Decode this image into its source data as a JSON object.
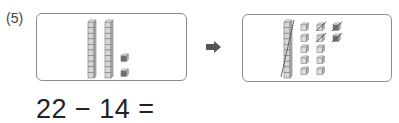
{
  "problem": {
    "number_label": "(5)",
    "equation": "22 − 14 =",
    "arrow_icon": "right-arrow-icon"
  },
  "before_panel": {
    "tens_rods": 2,
    "cubes_per_rod": 10,
    "ones_cubes": 2,
    "ones_color": "#6e6e6e"
  },
  "after_panel": {
    "tens_rods": 1,
    "tens_rods_crossed": 1,
    "ones_columns": [
      {
        "count": 5,
        "crossed": 0,
        "color": "#c8c8c8"
      },
      {
        "count": 5,
        "crossed": 2,
        "color": "#c8c8c8"
      },
      {
        "count": 2,
        "crossed": 2,
        "color": "#6e6e6e"
      }
    ]
  },
  "colors": {
    "cube_fill": "#d6d6d6",
    "cube_stroke": "#7a7a7a",
    "dark_cube": "#6e6e6e",
    "box_border": "#8c8c8c",
    "arrow": "#555555"
  }
}
